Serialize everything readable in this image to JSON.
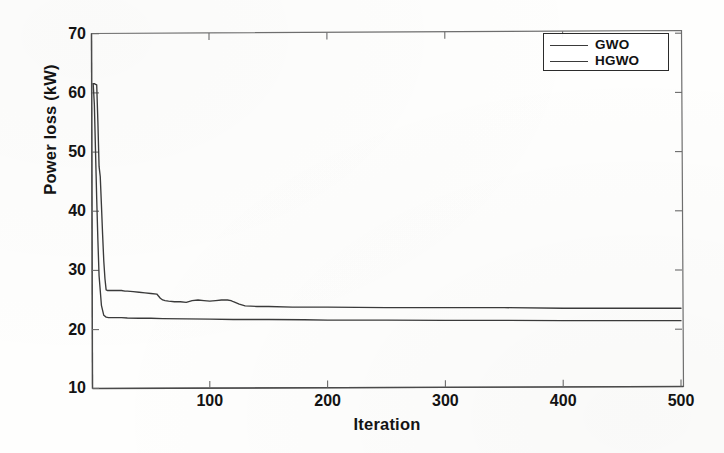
{
  "chart_data": {
    "type": "line",
    "title": "",
    "xlabel": "Iteration",
    "ylabel": "Power loss (kW)",
    "xlim": [
      0,
      500
    ],
    "ylim": [
      10,
      70
    ],
    "xticks": [
      100,
      200,
      300,
      400,
      500
    ],
    "yticks": [
      10,
      20,
      30,
      40,
      50,
      60,
      70
    ],
    "grid": false,
    "legend_position": "top-right",
    "series": [
      {
        "name": "GWO",
        "color": "#3a3a3a",
        "x": [
          1,
          2,
          3,
          4,
          5,
          6,
          7,
          8,
          9,
          10,
          11,
          12,
          13,
          14,
          15,
          18,
          20,
          22,
          25,
          28,
          30,
          35,
          40,
          45,
          50,
          55,
          58,
          60,
          62,
          65,
          70,
          75,
          80,
          85,
          90,
          95,
          100,
          105,
          110,
          115,
          118,
          120,
          125,
          130,
          140,
          150,
          170,
          200,
          250,
          300,
          350,
          400,
          450,
          500
        ],
        "y": [
          61.5,
          61.5,
          61.4,
          61.3,
          55.0,
          47.5,
          45.8,
          41.0,
          36.0,
          31.5,
          28.5,
          26.6,
          26.5,
          26.5,
          26.5,
          26.5,
          26.5,
          26.5,
          26.5,
          26.4,
          26.4,
          26.3,
          26.2,
          26.1,
          26.0,
          25.9,
          25.2,
          24.9,
          24.8,
          24.7,
          24.6,
          24.6,
          24.5,
          24.8,
          24.9,
          24.8,
          24.7,
          24.8,
          24.9,
          24.9,
          24.8,
          24.6,
          24.2,
          23.9,
          23.8,
          23.8,
          23.7,
          23.7,
          23.6,
          23.6,
          23.6,
          23.5,
          23.5,
          23.5
        ]
      },
      {
        "name": "HGWO",
        "color": "#3a3a3a",
        "x": [
          1,
          2,
          3,
          4,
          5,
          6,
          8,
          10,
          12,
          14,
          16,
          18,
          20,
          25,
          30,
          40,
          50,
          60,
          80,
          100,
          120,
          150,
          180,
          200,
          250,
          300,
          350,
          400,
          450,
          500
        ],
        "y": [
          61.5,
          58.0,
          50.0,
          42.0,
          35.0,
          29.0,
          24.0,
          22.3,
          22.0,
          21.9,
          21.9,
          21.9,
          21.9,
          21.9,
          21.85,
          21.8,
          21.8,
          21.75,
          21.7,
          21.65,
          21.6,
          21.6,
          21.55,
          21.5,
          21.5,
          21.45,
          21.45,
          21.4,
          21.4,
          21.4
        ]
      }
    ]
  },
  "legend": {
    "items": [
      {
        "label": "GWO"
      },
      {
        "label": "HGWO"
      }
    ]
  },
  "axes": {
    "x_tick_labels": [
      "100",
      "200",
      "300",
      "400",
      "500"
    ],
    "y_tick_labels": [
      "70",
      "60",
      "50",
      "40",
      "30",
      "20",
      "10"
    ],
    "x_title": "Iteration",
    "y_title": "Power loss (kW)"
  }
}
